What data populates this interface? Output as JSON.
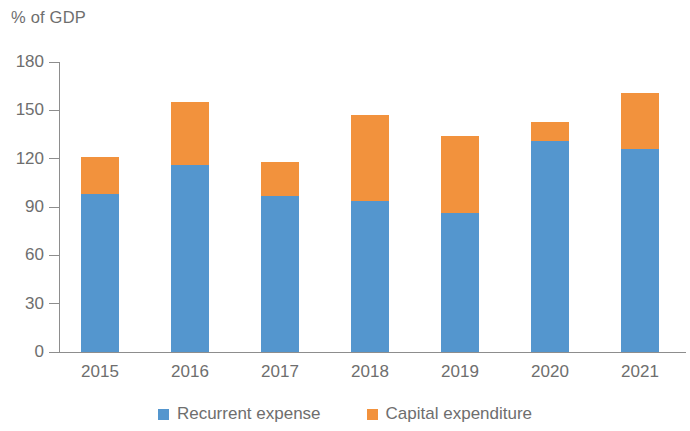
{
  "chart_data": {
    "type": "bar",
    "subtype": "stacked-column",
    "title": "% of GDP",
    "xlabel": "",
    "ylabel": "% of GDP",
    "ylim": [
      0,
      180
    ],
    "yticks": [
      180,
      150,
      120,
      90,
      60,
      30,
      0
    ],
    "grid": false,
    "legend_position": "bottom-center",
    "categories": [
      "2015",
      "2016",
      "2017",
      "2018",
      "2019",
      "2020",
      "2021"
    ],
    "series": [
      {
        "name": "Recurrent expense",
        "color": "#5496CE",
        "values": [
          98,
          116,
          97,
          94,
          86,
          131,
          126
        ]
      },
      {
        "name": "Capital expenditure",
        "color": "#F2923D",
        "values": [
          23,
          39,
          21,
          53,
          48,
          12,
          35
        ]
      }
    ],
    "totals": [
      121,
      155,
      118,
      147,
      134,
      143,
      161
    ]
  },
  "legend": {
    "items": [
      {
        "label": "Recurrent expense",
        "color": "#5496CE",
        "swatch": "square-swatch-blue"
      },
      {
        "label": "Capital expenditure",
        "color": "#F2923D",
        "swatch": "square-swatch-orange"
      }
    ]
  }
}
